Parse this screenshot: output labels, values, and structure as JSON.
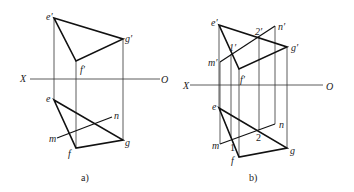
{
  "figure_a": {
    "caption": "a)",
    "axis": {
      "left_label": "X",
      "right_label": "O"
    },
    "points": {
      "e_prime": "e′",
      "f_prime": "f′",
      "g_prime": "g′",
      "e": "e",
      "f": "f",
      "g": "g",
      "m": "m",
      "n": "n"
    }
  },
  "figure_b": {
    "caption": "b)",
    "axis": {
      "left_label": "X",
      "right_label": "O"
    },
    "points": {
      "e_prime": "e′",
      "f_prime": "f′",
      "g_prime": "g′",
      "m_prime": "m′",
      "n_prime": "n′",
      "one_prime": "1′",
      "two_prime": "2′",
      "e": "e",
      "f": "f",
      "g": "g",
      "m": "m",
      "n": "n",
      "one": "1",
      "two": "2"
    }
  }
}
